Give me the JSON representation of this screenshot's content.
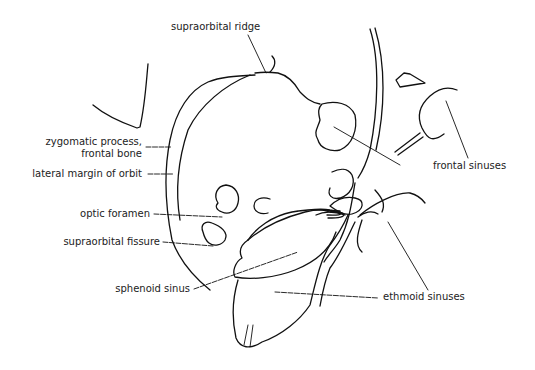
{
  "figure": {
    "labels": {
      "supraorbital_ridge": "supraorbital ridge",
      "zygomatic_process_line1": "zygomatic process,",
      "zygomatic_process_line2": "frontal bone",
      "lateral_margin": "lateral margin of orbit",
      "optic_foramen": "optic foramen",
      "supraorbital_fissure": "supraorbital fissure",
      "sphenoid_sinus": "sphenoid sinus",
      "frontal_sinuses": "frontal sinuses",
      "ethmoid_sinuses": "ethmoid sinuses"
    },
    "colors": {
      "line": "#111111",
      "text": "#222222",
      "background": "#ffffff"
    }
  }
}
